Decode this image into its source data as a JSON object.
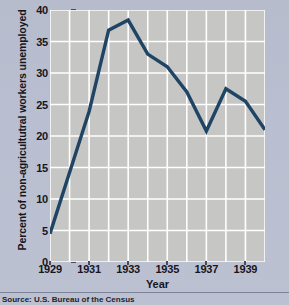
{
  "figure": {
    "background_color": "#b9bed0",
    "plot_background_color": "#c6c6c4",
    "grid_color": "#ffffff",
    "line_color": "#1f4464",
    "caption": "Source: U.S. Bureau of the Census"
  },
  "chart_data": {
    "type": "line",
    "title": "",
    "subtitle": "",
    "xlabel": "Year",
    "ylabel": "Percent of non-agricultutral workers unemployed",
    "xlim": [
      1929,
      1940
    ],
    "ylim": [
      0,
      40
    ],
    "x": [
      1929,
      1930,
      1931,
      1932,
      1933,
      1934,
      1935,
      1936,
      1937,
      1938,
      1939,
      1940
    ],
    "values": [
      4.5,
      14.2,
      23.9,
      36.8,
      38.4,
      33.0,
      31.0,
      27.0,
      20.8,
      27.5,
      25.5,
      21.0
    ],
    "series": [
      {
        "name": "Percent unemployed",
        "values": [
          4.5,
          14.2,
          23.9,
          36.8,
          38.4,
          33.0,
          31.0,
          27.0,
          20.8,
          27.5,
          25.5,
          21.0
        ]
      }
    ],
    "x_ticks": [
      1929,
      1931,
      1933,
      1935,
      1937,
      1939
    ],
    "x_tick_labels": [
      "1929",
      "1931",
      "1933",
      "1935",
      "1937",
      "1939"
    ],
    "x_minor_ticks": [
      1930,
      1932,
      1934,
      1936,
      1938,
      1940
    ],
    "y_ticks": [
      0,
      5,
      10,
      15,
      20,
      25,
      30,
      35,
      40
    ],
    "y_tick_labels": [
      "0",
      "5",
      "10",
      "15",
      "20",
      "25",
      "30",
      "35",
      "40"
    ],
    "grid": true,
    "grid_axes": "both",
    "legend": false,
    "legend_position": "none",
    "markers": false,
    "line_width": 3
  }
}
